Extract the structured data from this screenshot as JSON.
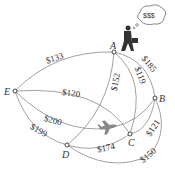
{
  "diagram": {
    "type": "weighted-graph",
    "nodes": [
      {
        "id": "A",
        "label": "A"
      },
      {
        "id": "B",
        "label": "B"
      },
      {
        "id": "C",
        "label": "C"
      },
      {
        "id": "D",
        "label": "D"
      },
      {
        "id": "E",
        "label": "E"
      }
    ],
    "edges": [
      {
        "from": "E",
        "to": "A",
        "label": "$133"
      },
      {
        "from": "A",
        "to": "B",
        "label": "$185"
      },
      {
        "from": "A",
        "to": "C",
        "label": "$119"
      },
      {
        "from": "A",
        "to": "D",
        "label": "$152"
      },
      {
        "from": "E",
        "to": "C",
        "label": "$120"
      },
      {
        "from": "E",
        "to": "B",
        "label": "$200"
      },
      {
        "from": "E",
        "to": "D",
        "label": "$199"
      },
      {
        "from": "D",
        "to": "C",
        "label": "$174"
      },
      {
        "from": "C",
        "to": "B",
        "label": "$121"
      },
      {
        "from": "D",
        "to": "B",
        "label": "$150"
      }
    ],
    "thought_bubble": "$$$",
    "icons": [
      "traveler-icon",
      "airplane-icon"
    ]
  }
}
